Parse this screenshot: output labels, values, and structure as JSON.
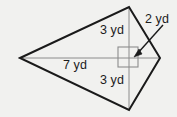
{
  "figure": {
    "type": "kite-quadrilateral",
    "background_color": "#f1f1ef",
    "outline_color": "#1a1a1a",
    "interior_line_color": "#8c8c8c",
    "label_color": "#1b1b1b",
    "labels": {
      "upper_segment": "3 yd",
      "lower_segment": "3 yd",
      "horizontal_diagonal": "7 yd",
      "arrow_dimension": "2 yd"
    },
    "measurements": [
      {
        "name": "upper_segment",
        "value": 3,
        "unit": "yd"
      },
      {
        "name": "lower_segment",
        "value": 3,
        "unit": "yd"
      },
      {
        "name": "horizontal_diagonal",
        "value": 7,
        "unit": "yd"
      },
      {
        "name": "arrow_dimension",
        "value": 2,
        "unit": "yd"
      }
    ],
    "vertices": {
      "left": {
        "x": 20,
        "y": 58
      },
      "top": {
        "x": 129,
        "y": 7
      },
      "right": {
        "x": 160,
        "y": 58
      },
      "bottom": {
        "x": 129,
        "y": 110
      }
    },
    "right_angle_marker": {
      "x": 118,
      "y": 47,
      "size": 20
    },
    "arrow": {
      "from_x": 162,
      "from_y": 27,
      "to_x": 136,
      "to_y": 55
    }
  }
}
